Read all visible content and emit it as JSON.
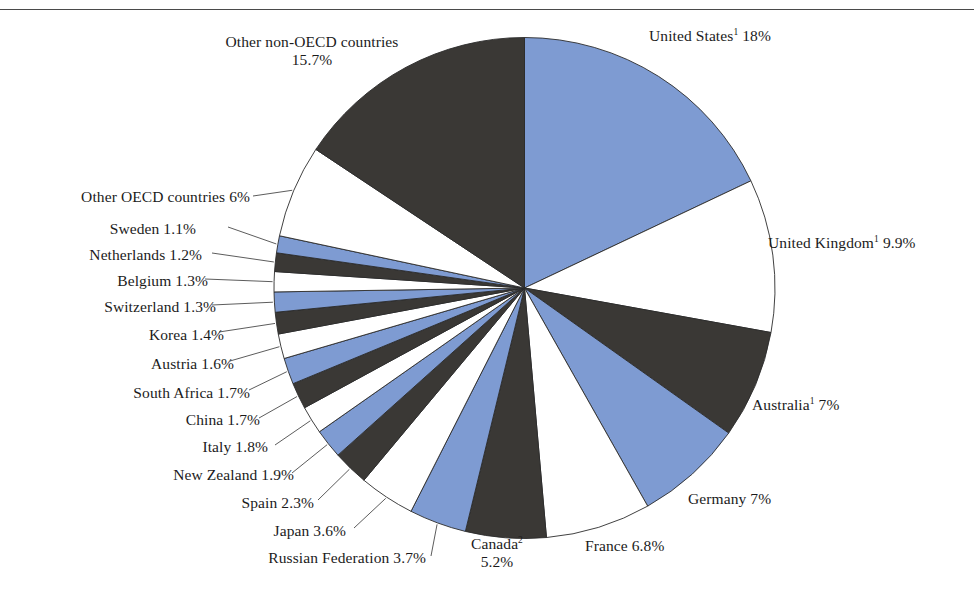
{
  "figure": {
    "has_top_rule": true,
    "background": "#ffffff"
  },
  "colors": {
    "blue": "#7e9bd2",
    "dark": "#3a3835",
    "white": "#ffffff",
    "outline": "#2b2b2b",
    "leader": "#4a4a4a",
    "text": "#1b1b1b"
  },
  "chart_data": {
    "type": "pie",
    "title": "",
    "subtitle": "",
    "xlabel": "",
    "ylabel": "",
    "legend_position": "none",
    "grid": false,
    "start_angle_deg": 0,
    "direction": "clockwise",
    "units": "percent",
    "labels_outside": true,
    "slices": [
      {
        "name": "United States",
        "footnote": "1",
        "value": 18.0,
        "value_label": "18%",
        "color": "blue",
        "label_text": "United States",
        "label_value": "18%"
      },
      {
        "name": "United Kingdom",
        "footnote": "1",
        "value": 9.9,
        "value_label": "9.9%",
        "color": "white",
        "label_text": "United Kingdom",
        "label_value": "9.9%"
      },
      {
        "name": "Australia",
        "footnote": "1",
        "value": 7.0,
        "value_label": "7%",
        "color": "dark",
        "label_text": "Australia",
        "label_value": "7%"
      },
      {
        "name": "Germany",
        "footnote": "",
        "value": 7.0,
        "value_label": "7%",
        "color": "blue",
        "label_text": "Germany",
        "label_value": "7%"
      },
      {
        "name": "France",
        "footnote": "",
        "value": 6.8,
        "value_label": "6.8%",
        "color": "white",
        "label_text": "France",
        "label_value": "6.8%"
      },
      {
        "name": "Canada",
        "footnote": "2",
        "value": 5.2,
        "value_label": "5.2%",
        "color": "dark",
        "label_text": "Canada",
        "label_value": "5.2%"
      },
      {
        "name": "Russian Federation",
        "footnote": "",
        "value": 3.7,
        "value_label": "3.7%",
        "color": "blue",
        "label_text": "Russian Federation",
        "label_value": "3.7%"
      },
      {
        "name": "Japan",
        "footnote": "",
        "value": 3.6,
        "value_label": "3.6%",
        "color": "white",
        "label_text": "Japan",
        "label_value": "3.6%"
      },
      {
        "name": "Spain",
        "footnote": "",
        "value": 2.3,
        "value_label": "2.3%",
        "color": "dark",
        "label_text": "Spain",
        "label_value": "2.3%"
      },
      {
        "name": "New Zealand",
        "footnote": "",
        "value": 1.9,
        "value_label": "1.9%",
        "color": "blue",
        "label_text": "New Zealand",
        "label_value": "1.9%"
      },
      {
        "name": "Italy",
        "footnote": "",
        "value": 1.8,
        "value_label": "1.8%",
        "color": "white",
        "label_text": "Italy",
        "label_value": "1.8%"
      },
      {
        "name": "China",
        "footnote": "",
        "value": 1.7,
        "value_label": "1.7%",
        "color": "dark",
        "label_text": "China",
        "label_value": "1.7%"
      },
      {
        "name": "South Africa",
        "footnote": "",
        "value": 1.7,
        "value_label": "1.7%",
        "color": "blue",
        "label_text": "South Africa",
        "label_value": "1.7%"
      },
      {
        "name": "Austria",
        "footnote": "",
        "value": 1.6,
        "value_label": "1.6%",
        "color": "white",
        "label_text": "Austria",
        "label_value": "1.6%"
      },
      {
        "name": "Korea",
        "footnote": "",
        "value": 1.4,
        "value_label": "1.4%",
        "color": "dark",
        "label_text": "Korea",
        "label_value": "1.4%"
      },
      {
        "name": "Switzerland",
        "footnote": "",
        "value": 1.3,
        "value_label": "1.3%",
        "color": "blue",
        "label_text": "Switzerland",
        "label_value": "1.3%"
      },
      {
        "name": "Belgium",
        "footnote": "",
        "value": 1.3,
        "value_label": "1.3%",
        "color": "white",
        "label_text": "Belgium",
        "label_value": "1.3%"
      },
      {
        "name": "Netherlands",
        "footnote": "",
        "value": 1.2,
        "value_label": "1.2%",
        "color": "dark",
        "label_text": "Netherlands",
        "label_value": "1.2%"
      },
      {
        "name": "Sweden",
        "footnote": "",
        "value": 1.1,
        "value_label": "1.1%",
        "color": "blue",
        "label_text": "Sweden",
        "label_value": "1.1%"
      },
      {
        "name": "Other OECD countries",
        "footnote": "",
        "value": 6.0,
        "value_label": "6%",
        "color": "white",
        "label_text": "Other OECD countries",
        "label_value": "6%"
      },
      {
        "name": "Other non-OECD countries",
        "footnote": "",
        "value": 15.7,
        "value_label": "15.7%",
        "color": "dark",
        "label_text": "Other non-OECD countries",
        "label_value": "15.7%"
      }
    ]
  },
  "labels": {
    "us": {
      "line1": "United States",
      "sup": "1",
      "line2": "18%"
    },
    "uk": {
      "line1": "United Kingdom",
      "sup": "1",
      "line2": "9.9%"
    },
    "australia": {
      "line1": "Australia",
      "sup": "1",
      "line2": "7%"
    },
    "germany": {
      "line1": "Germany 7%"
    },
    "france": {
      "line1": "France 6.8%"
    },
    "canada": {
      "line1": "Canada",
      "sup": "2",
      "line2": "5.2%"
    },
    "russia": {
      "line1": "Russian Federation 3.7%"
    },
    "japan": {
      "line1": "Japan  3.6%"
    },
    "spain": {
      "line1": "Spain  2.3%"
    },
    "newzealand": {
      "line1": "New Zealand  1.9%"
    },
    "italy": {
      "line1": "Italy 1.8%"
    },
    "china": {
      "line1": "China 1.7%"
    },
    "southafrica": {
      "line1": "South Africa  1.7%"
    },
    "austria": {
      "line1": "Austria  1.6%"
    },
    "korea": {
      "line1": "Korea  1.4%"
    },
    "switzerland": {
      "line1": "Switzerland  1.3%"
    },
    "belgium": {
      "line1": "Belgium  1.3%"
    },
    "netherlands": {
      "line1": "Netherlands  1.2%"
    },
    "sweden": {
      "line1": "Sweden  1.1%"
    },
    "otheroecd": {
      "line1": "Other OECD countries  6%"
    },
    "othernonoecd": {
      "line1": "Other non-OECD countries",
      "line2": "15.7%"
    }
  }
}
